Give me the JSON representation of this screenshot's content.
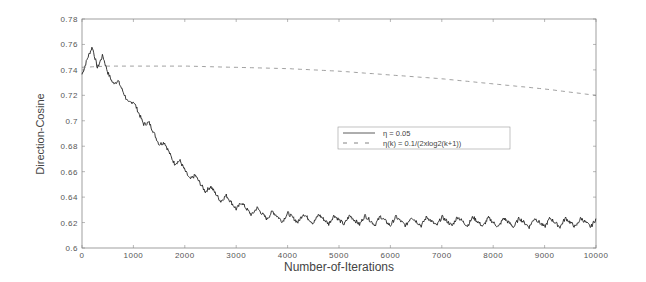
{
  "chart_data": {
    "type": "line",
    "title": "",
    "xlabel": "Number-of-Iterations",
    "ylabel": "Direction-Cosine",
    "xlim": [
      0,
      10000
    ],
    "ylim": [
      0.6,
      0.78
    ],
    "grid": false,
    "xticks": [
      0,
      1000,
      2000,
      3000,
      4000,
      5000,
      6000,
      7000,
      8000,
      9000,
      10000
    ],
    "xtick_labels": [
      "0",
      "1000",
      "2000",
      "3000",
      "4000",
      "5000",
      "6000",
      "7000",
      "8000",
      "9000",
      "10000"
    ],
    "yticks": [
      0.6,
      0.62,
      0.64,
      0.66,
      0.68,
      0.7,
      0.72,
      0.74,
      0.76,
      0.78
    ],
    "ytick_labels": [
      "0.6",
      "0.62",
      "0.64",
      "0.66",
      "0.68",
      "0.7",
      "0.72",
      "0.74",
      "0.76",
      "0.78"
    ],
    "legend_position": "center-right",
    "series": [
      {
        "name": "η = 0.05",
        "style": "solid",
        "color": "#222222",
        "x": [
          0,
          100,
          200,
          300,
          400,
          500,
          700,
          1000,
          1250,
          1500,
          1750,
          2000,
          2250,
          2500,
          2750,
          3000,
          3250,
          3500,
          3750,
          4000,
          4500,
          5000,
          5500,
          6000,
          6500,
          7000,
          7500,
          8000,
          8500,
          9000,
          9500,
          10000
        ],
        "y": [
          0.74,
          0.745,
          0.758,
          0.745,
          0.748,
          0.738,
          0.728,
          0.712,
          0.698,
          0.685,
          0.672,
          0.661,
          0.652,
          0.645,
          0.639,
          0.634,
          0.63,
          0.627,
          0.625,
          0.624,
          0.623,
          0.622,
          0.622,
          0.621,
          0.621,
          0.621,
          0.621,
          0.62,
          0.62,
          0.62,
          0.62,
          0.62
        ],
        "oscillation_amplitude": 0.005,
        "oscillation_period": 300
      },
      {
        "name": "η(k) = 0.1/(2xlog2(k+1))",
        "style": "dashed",
        "color": "#777777",
        "x": [
          0,
          500,
          1000,
          2000,
          3000,
          4000,
          5000,
          6000,
          7000,
          8000,
          9000,
          10000
        ],
        "y": [
          0.742,
          0.743,
          0.743,
          0.743,
          0.742,
          0.741,
          0.739,
          0.736,
          0.733,
          0.729,
          0.725,
          0.72
        ]
      }
    ]
  },
  "legend": {
    "entries": [
      {
        "label": "η = 0.05"
      },
      {
        "label": "η(k) = 0.1/(2xlog2(k+1))"
      }
    ]
  }
}
